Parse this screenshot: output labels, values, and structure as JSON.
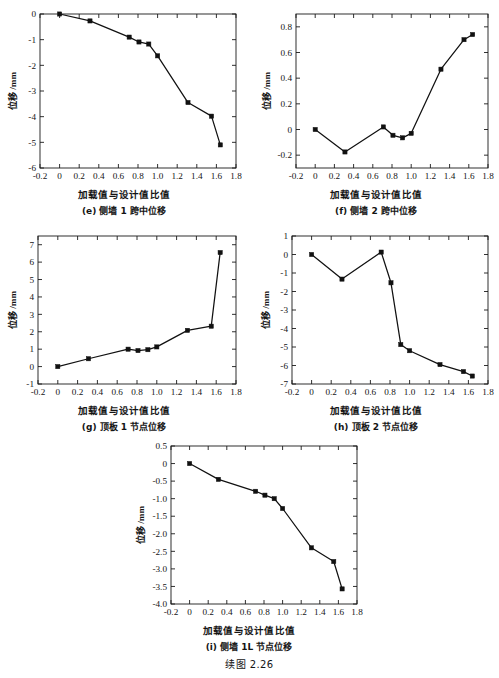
{
  "page": {
    "background_color": "#ffffff",
    "figure_caption": "续图 2.26",
    "axis_color": "#1a1a1a",
    "series_color": "#111111"
  },
  "common": {
    "xlabel": "加载值与设计值比值",
    "ylabel": "位移 /mm",
    "xticks": [
      "-0.2",
      "0",
      "0.2",
      "0.4",
      "0.6",
      "0.8",
      "1.0",
      "1.2",
      "1.4",
      "1.6",
      "1.8"
    ],
    "xlim": [
      -0.2,
      1.8
    ]
  },
  "chart_data": [
    {
      "id": "e",
      "type": "line",
      "title": "(e) 侧墙 1 跨中位移",
      "xlabel": "加载值与设计值比值",
      "ylabel": "位移 /mm",
      "xlim": [
        -0.2,
        1.8
      ],
      "ylim": [
        -6,
        0
      ],
      "xticks": [
        "-0.2",
        "0",
        "0.2",
        "0.4",
        "0.6",
        "0.8",
        "1.0",
        "1.2",
        "1.4",
        "1.6",
        "1.8"
      ],
      "yticks": [
        "0",
        "-1",
        "-2",
        "-3",
        "-4",
        "-5",
        "-6"
      ],
      "ytick_values": [
        0,
        -1,
        -2,
        -3,
        -4,
        -5,
        -6
      ],
      "grid": false,
      "legend": "none",
      "marker": "square",
      "x": [
        0,
        0.31,
        0.71,
        0.81,
        0.91,
        1.0,
        1.31,
        1.55,
        1.64
      ],
      "values": [
        0,
        -0.27,
        -0.9,
        -1.09,
        -1.17,
        -1.63,
        -3.45,
        -3.98,
        -5.1
      ]
    },
    {
      "id": "f",
      "type": "line",
      "title": "(f) 侧墙 2 跨中位移",
      "xlabel": "加载值与设计值比值",
      "ylabel": "位移 /mm",
      "xlim": [
        -0.2,
        1.8
      ],
      "ylim": [
        -0.3,
        0.9
      ],
      "xticks": [
        "-0.2",
        "0",
        "0.2",
        "0.4",
        "0.6",
        "0.8",
        "1.0",
        "1.2",
        "1.4",
        "1.6",
        "1.8"
      ],
      "yticks": [
        "0.8",
        "0.6",
        "0.4",
        "0.2",
        "0",
        "-0.2"
      ],
      "ytick_values": [
        0.8,
        0.6,
        0.4,
        0.2,
        0,
        -0.2
      ],
      "grid": false,
      "legend": "none",
      "marker": "square",
      "x": [
        0,
        0.31,
        0.71,
        0.81,
        0.91,
        1.0,
        1.31,
        1.55,
        1.64
      ],
      "values": [
        0,
        -0.175,
        0.02,
        -0.045,
        -0.065,
        -0.03,
        0.47,
        0.7,
        0.74
      ]
    },
    {
      "id": "g",
      "type": "line",
      "title": "(g) 顶板 1 节点位移",
      "xlabel": "加载值与设计值比值",
      "ylabel": "位移 /mm",
      "xlim": [
        -0.2,
        1.8
      ],
      "ylim": [
        -1,
        7.5
      ],
      "xticks": [
        "-0.2",
        "0",
        "0.2",
        "0.4",
        "0.6",
        "0.8",
        "1.0",
        "1.2",
        "1.4",
        "1.6",
        "1.8"
      ],
      "yticks": [
        "7",
        "6",
        "5",
        "4",
        "3",
        "2",
        "1",
        "0",
        "-1"
      ],
      "ytick_values": [
        7,
        6,
        5,
        4,
        3,
        2,
        1,
        0,
        -1
      ],
      "grid": false,
      "legend": "none",
      "marker": "square",
      "x": [
        0,
        0.31,
        0.71,
        0.81,
        0.91,
        1.0,
        1.31,
        1.55,
        1.64
      ],
      "values": [
        0,
        0.45,
        1.0,
        0.92,
        0.97,
        1.13,
        2.08,
        2.32,
        6.55
      ]
    },
    {
      "id": "h",
      "type": "line",
      "title": "(h) 顶板 2 节点位移",
      "xlabel": "加载值与设计值比值",
      "ylabel": "位移 /mm",
      "xlim": [
        -0.2,
        1.8
      ],
      "ylim": [
        -7,
        1
      ],
      "xticks": [
        "-0.2",
        "0",
        "0.2",
        "0.4",
        "0.6",
        "0.8",
        "1.0",
        "1.2",
        "1.4",
        "1.6",
        "1.8"
      ],
      "yticks": [
        "1",
        "0",
        "-1",
        "-2",
        "-3",
        "-4",
        "-5",
        "-6",
        "-7"
      ],
      "ytick_values": [
        1,
        0,
        -1,
        -2,
        -3,
        -4,
        -5,
        -6,
        -7
      ],
      "grid": false,
      "legend": "none",
      "marker": "square",
      "x": [
        0,
        0.31,
        0.71,
        0.81,
        0.91,
        1.0,
        1.31,
        1.55,
        1.64
      ],
      "values": [
        0,
        -1.33,
        0.13,
        -1.53,
        -4.87,
        -5.2,
        -5.95,
        -6.33,
        -6.57
      ]
    },
    {
      "id": "i",
      "type": "line",
      "title": "(i) 侧墙 1L 节点位移",
      "xlabel": "加载值与设计值比值",
      "ylabel": "位移 /mm",
      "xlim": [
        -0.2,
        1.8
      ],
      "ylim": [
        -4.0,
        0.5
      ],
      "xticks": [
        "-0.2",
        "0",
        "0.2",
        "0.4",
        "0.6",
        "0.8",
        "1.0",
        "1.2",
        "1.4",
        "1.6",
        "1.8"
      ],
      "yticks": [
        "0.5",
        "0",
        "-0.5",
        "-1.0",
        "-1.5",
        "-2.0",
        "-2.5",
        "-3.0",
        "-3.5",
        "-4.0"
      ],
      "ytick_values": [
        0.5,
        0,
        -0.5,
        -1.0,
        -1.5,
        -2.0,
        -2.5,
        -3.0,
        -3.5,
        -4.0
      ],
      "grid": false,
      "legend": "none",
      "marker": "square",
      "x": [
        0,
        0.31,
        0.71,
        0.81,
        0.91,
        1.0,
        1.31,
        1.55,
        1.64
      ],
      "values": [
        0,
        -0.45,
        -0.79,
        -0.9,
        -1.0,
        -1.28,
        -2.4,
        -2.79,
        -3.57
      ]
    }
  ]
}
